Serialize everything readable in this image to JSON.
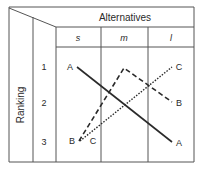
{
  "header": {
    "title": "Alternatives",
    "columns": [
      "s",
      "m",
      "l"
    ]
  },
  "rows": {
    "axis_label": "Ranking",
    "ranks": [
      "1",
      "2",
      "3"
    ]
  },
  "series": [
    {
      "name": "A",
      "style": "solid",
      "ranks": {
        "s": 1,
        "m": 2,
        "l": 3
      }
    },
    {
      "name": "B",
      "style": "dashed",
      "ranks": {
        "s": 3,
        "m": 1,
        "l": 2
      }
    },
    {
      "name": "C",
      "style": "dotted",
      "ranks": {
        "s": 3,
        "m": 2,
        "l": 1
      }
    }
  ],
  "point_labels": {
    "s_rank1": "A",
    "s_rank3_b": "B",
    "s_rank3_c": "C",
    "l_rank1": "C",
    "l_rank2": "B",
    "l_rank3": "A"
  },
  "colors": {
    "line": "#2a2a2a",
    "grid": "#555555",
    "background": "#ffffff"
  }
}
